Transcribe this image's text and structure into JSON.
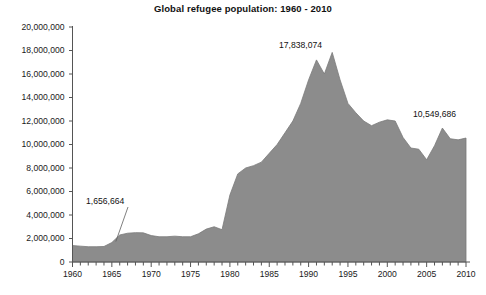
{
  "chart_data": {
    "type": "area",
    "title": "Global refugee population: 1960 - 2010",
    "xlabel": "",
    "ylabel": "",
    "xlim": [
      1960,
      2010
    ],
    "ylim": [
      0,
      20000000
    ],
    "grid": false,
    "legend": "none",
    "fill_color": "#8c8c8c",
    "line_color": "#7a7a7a",
    "axis_color": "#555555",
    "y_ticks": [
      "0",
      "2,000,000",
      "4,000,000",
      "6,000,000",
      "8,000,000",
      "10,000,000",
      "12,000,000",
      "14,000,000",
      "16,000,000",
      "18,000,000",
      "20,000,000"
    ],
    "y_tick_values": [
      0,
      2000000,
      4000000,
      6000000,
      8000000,
      10000000,
      12000000,
      14000000,
      16000000,
      18000000,
      20000000
    ],
    "x_ticks": [
      "1960",
      "1965",
      "1970",
      "1975",
      "1980",
      "1985",
      "1990",
      "1995",
      "2000",
      "2005",
      "2010"
    ],
    "x_tick_values": [
      1960,
      1965,
      1970,
      1975,
      1980,
      1985,
      1990,
      1995,
      2000,
      2005,
      2010
    ],
    "x_minor_tick_step": 1,
    "x": [
      1960,
      1961,
      1962,
      1963,
      1964,
      1965,
      1966,
      1967,
      1968,
      1969,
      1970,
      1971,
      1972,
      1973,
      1974,
      1975,
      1976,
      1977,
      1978,
      1979,
      1980,
      1981,
      1982,
      1983,
      1984,
      1985,
      1986,
      1987,
      1988,
      1989,
      1990,
      1991,
      1992,
      1993,
      1994,
      1995,
      1996,
      1997,
      1998,
      1999,
      2000,
      2001,
      2002,
      2003,
      2004,
      2005,
      2006,
      2007,
      2008,
      2009,
      2010
    ],
    "values": [
      1400000,
      1350000,
      1300000,
      1300000,
      1320000,
      1656664,
      2300000,
      2450000,
      2500000,
      2480000,
      2250000,
      2150000,
      2150000,
      2200000,
      2150000,
      2150000,
      2400000,
      2800000,
      3000000,
      2750000,
      5700000,
      7500000,
      8000000,
      8200000,
      8500000,
      9250000,
      10000000,
      11000000,
      12000000,
      13500000,
      15500000,
      17200000,
      16000000,
      17838074,
      15500000,
      13500000,
      12700000,
      12000000,
      11600000,
      11900000,
      12100000,
      12000000,
      10600000,
      9700000,
      9600000,
      8700000,
      9900000,
      11400000,
      10489812,
      10396540,
      10549686
    ],
    "annotations": [
      {
        "text": "1,656,664",
        "year": 1965,
        "value": 1656664,
        "label_x": 86,
        "label_y": 196
      },
      {
        "text": "17,838,074",
        "year": 1993,
        "value": 17838074,
        "label_x": 279,
        "label_y": 40
      },
      {
        "text": "10,549,686",
        "year": 2010,
        "value": 10549686,
        "label_x": 413,
        "label_y": 109
      }
    ]
  }
}
